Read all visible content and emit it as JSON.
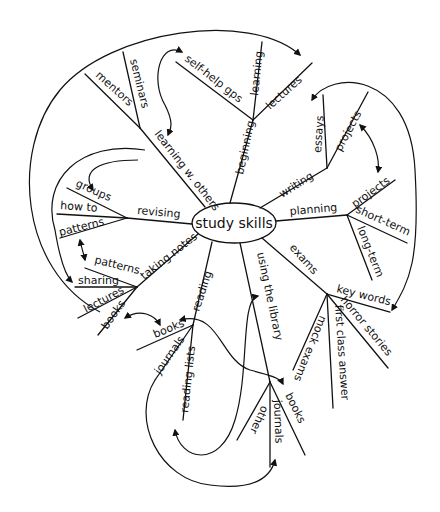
{
  "diagram": {
    "type": "mind-map",
    "style": "hand-drawn",
    "center": "study skills",
    "branches": [
      {
        "label": "learning w. others",
        "children": [
          "mentors",
          "seminars"
        ]
      },
      {
        "label": "beginning",
        "children": [
          "self-help gps",
          "learning",
          "lectures"
        ]
      },
      {
        "label": "writing",
        "children": [
          "essays",
          "projects"
        ]
      },
      {
        "label": "planning",
        "children": [
          "projects",
          "short-term",
          "long-term"
        ]
      },
      {
        "label": "exams",
        "children": [
          "key words",
          "horror stories",
          "first class answer",
          "mock exams"
        ]
      },
      {
        "label": "using the library",
        "children": [
          "books",
          "journals",
          "other"
        ]
      },
      {
        "label": "reading",
        "children": [
          "books",
          "journals",
          "reading lists"
        ]
      },
      {
        "label": "taking notes",
        "children": [
          "patterns",
          "sharing",
          "lectures",
          "books"
        ]
      },
      {
        "label": "revising",
        "children": [
          "groups",
          "how to",
          "patterns"
        ]
      }
    ],
    "cross_links": [
      [
        "beginning.self-help gps",
        "learning w. others"
      ],
      [
        "beginning.lectures",
        "taking notes.lectures"
      ],
      [
        "writing.essays",
        "exams.key words"
      ],
      [
        "writing.projects",
        "planning.projects"
      ],
      [
        "learning w. others",
        "revising.groups"
      ],
      [
        "learning w. others",
        "taking notes.sharing"
      ],
      [
        "revising.patterns",
        "taking notes.patterns"
      ],
      [
        "taking notes.books",
        "reading.books"
      ],
      [
        "reading.books",
        "using the library.books"
      ],
      [
        "reading.reading lists",
        "using the library"
      ],
      [
        "reading.journals",
        "using the library.journals"
      ]
    ]
  },
  "labels": {
    "center": "study skills",
    "learning_w_others": "learning w. others",
    "mentors": "mentors",
    "seminars": "seminars",
    "beginning": "beginning",
    "self_help": "self-help gps",
    "learning": "learning",
    "lectures_top": "lectures",
    "writing": "writing",
    "essays": "essays",
    "projects_w": "projects",
    "planning": "planning",
    "projects_p": "projects",
    "short_term": "short-term",
    "long_term": "long-term",
    "exams": "exams",
    "key_words": "key words",
    "horror_stories": "horror stories",
    "first_class": "first class answer",
    "mock_exams": "mock exams",
    "library": "using the library",
    "lib_books": "books",
    "lib_journals": "journals",
    "lib_other": "other",
    "reading": "reading",
    "read_books": "books",
    "read_journals": "journals",
    "reading_lists": "reading lists",
    "taking_notes": "taking notes",
    "tn_patterns": "patterns",
    "tn_sharing": "sharing",
    "tn_lectures": "lectures",
    "tn_books": "books",
    "revising": "revising",
    "groups": "groups",
    "how_to": "how to",
    "rev_patterns": "patterns"
  }
}
